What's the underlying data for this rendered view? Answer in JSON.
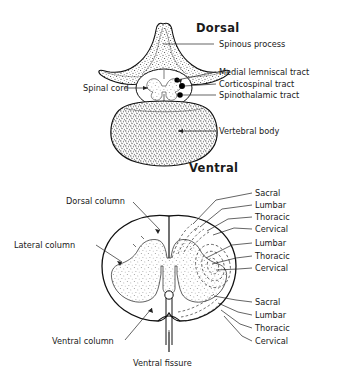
{
  "figure": {
    "title_implicit": "Vertebra and spinal cord cross sections",
    "background_color": "#ffffff",
    "ink_color": "#111111",
    "width": 339,
    "height": 376
  },
  "upper_figure": {
    "orientation_top": "Dorsal",
    "orientation_bottom": "Ventral",
    "labels": {
      "spinous_process": "Spinous process",
      "medial_lemniscal_tract": "Medial lemniscal tract",
      "corticospinal_tract": "Corticospinal tract",
      "spinothalamic_tract": "Spinothalamic tract",
      "spinal_cord": "Spinal cord",
      "vertebral_body": "Vertebral body"
    }
  },
  "lower_figure": {
    "labels": {
      "dorsal_column": "Dorsal column",
      "lateral_column": "Lateral column",
      "ventral_column": "Ventral column",
      "ventral_fissure": "Ventral fissure"
    },
    "dorsal_column_lamination": [
      "Sacral",
      "Lumbar",
      "Thoracic",
      "Cervical"
    ],
    "lateral_column_lamination": [
      "Lumbar",
      "Thoracic",
      "Cervical"
    ],
    "ventral_column_lamination": [
      "Sacral",
      "Lumbar",
      "Thoracic",
      "Cervical"
    ]
  }
}
